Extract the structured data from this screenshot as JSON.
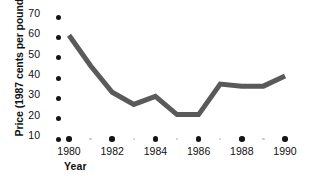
{
  "chart_data": {
    "type": "line",
    "title": "",
    "xlabel": "Year",
    "ylabel_line1": "Price",
    "ylabel_line2": "(1987 cents per pound)",
    "ylabel_full": "Price (1987 cents per pound)",
    "x": [
      1980,
      1981,
      1982,
      1983,
      1984,
      1985,
      1986,
      1987,
      1988,
      1989,
      1990
    ],
    "values": [
      61,
      46,
      33,
      27,
      31,
      22,
      22,
      37,
      36,
      36,
      41
    ],
    "series": [
      {
        "name": "Price",
        "values": [
          61,
          46,
          33,
          27,
          31,
          22,
          22,
          37,
          36,
          36,
          41
        ]
      }
    ],
    "xlim": [
      1979.4,
      1990.4
    ],
    "ylim": [
      10,
      73
    ],
    "xticks": [
      1980,
      1982,
      1984,
      1986,
      1988,
      1990
    ],
    "xtick_labels": [
      "1980",
      "1982",
      "1984",
      "1986",
      "1988",
      "1990"
    ],
    "xticks_minor": [
      1981,
      1983,
      1985,
      1987,
      1989
    ],
    "yticks": [
      10,
      20,
      30,
      40,
      50,
      60,
      70
    ],
    "ytick_labels": [
      "10",
      "20",
      "30",
      "40",
      "50",
      "60",
      "70"
    ],
    "grid": false,
    "legend": "none",
    "line_color": "#5a5a5a",
    "marker_color": "#151515",
    "minor_marker_color": "#c9c9c9",
    "background_color": "#ffffff"
  }
}
